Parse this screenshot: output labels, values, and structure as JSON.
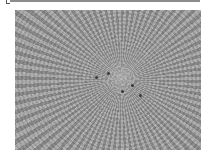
{
  "image": {
    "description": "grayscale radial swirl texture",
    "colors": {
      "background": "#ffffff",
      "top_bar": "#8c8c8c",
      "texture_dark": "#8a8a8a",
      "texture_light": "#b4b4b4",
      "speck": "#3a3a3a"
    }
  }
}
